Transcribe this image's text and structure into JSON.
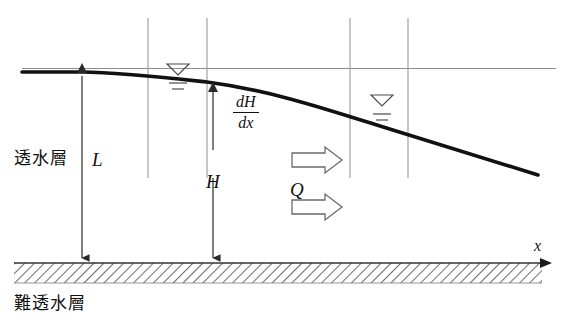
{
  "figure": {
    "labels": {
      "permeable_layer": "透水層",
      "impermeable_layer": "難透水層",
      "thickness_L": "L",
      "head_H": "H",
      "discharge_Q": "Q",
      "gradient_numerator": "dH",
      "gradient_denominator": "dx",
      "axis_x": "x"
    },
    "colors": {
      "curve": "#111111",
      "thin_line": "#8d8d8d",
      "well_line": "#9a9a9a",
      "hatch": "#6f6f6f",
      "text": "#111111",
      "arrow_outline": "#6a6a6a"
    },
    "geometry": {
      "width": 562,
      "height": 330,
      "datum_line_y": 72,
      "bedrock_top_y": 263,
      "bedrock_bottom_y": 283,
      "water_table_curve": [
        [
          22,
          72
        ],
        [
          82,
          72
        ],
        [
          148,
          75
        ],
        [
          207,
          81
        ],
        [
          275,
          94
        ],
        [
          350,
          114
        ],
        [
          408,
          132
        ],
        [
          470,
          152
        ],
        [
          538,
          175
        ]
      ],
      "well_lines_x": [
        148,
        207,
        350,
        408
      ],
      "well_line_top_y": 18,
      "well_line_bottom_y": 178,
      "dimension_L_x": 82,
      "dimension_H_x": 213,
      "flow_arrows_y": [
        160,
        207
      ],
      "water_table_symbols": [
        {
          "x": 178,
          "y": 70
        },
        {
          "x": 382,
          "y": 101
        }
      ]
    },
    "annotations": {
      "gradient_symbol": "dH/dx",
      "flow_direction": "left-to-right",
      "curve_type": "phreatic-surface"
    }
  }
}
